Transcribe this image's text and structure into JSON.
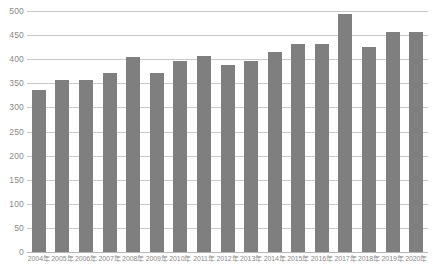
{
  "chart_data": {
    "type": "bar",
    "title": "",
    "xlabel": "",
    "ylabel": "",
    "ylim": [
      0,
      500
    ],
    "ytick_step": 50,
    "grid": true,
    "legend": "none",
    "bar_color": "#7f7f7f",
    "grid_color": "#c9c9c9",
    "label_color": "#8a8a8a",
    "background": "#ffffff",
    "ytick_labels": [
      "500",
      "450",
      "400",
      "350",
      "300",
      "250",
      "200",
      "150",
      "100",
      "50",
      "0"
    ],
    "ytick_values": [
      500,
      450,
      400,
      350,
      300,
      250,
      200,
      150,
      100,
      50,
      0
    ],
    "categories": [
      "2004年",
      "2005年",
      "2006年",
      "2007年",
      "2008年",
      "2009年",
      "2010年",
      "2011年",
      "2012年",
      "2013年",
      "2014年",
      "2015年",
      "2016年",
      "2017年",
      "2018年",
      "2019年",
      "2020年"
    ],
    "values": [
      337,
      356,
      357,
      371,
      405,
      372,
      396,
      407,
      389,
      396,
      416,
      432,
      432,
      493,
      426,
      457,
      457
    ]
  }
}
